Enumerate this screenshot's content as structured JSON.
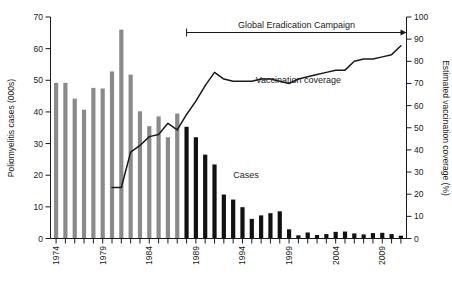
{
  "chart_data": {
    "type": "bar",
    "title": "",
    "xlabel": "",
    "ylabel": "Poliomyelitis cases (000s)",
    "y2label": "Estimated vaccination coverage (%)",
    "ylim": [
      0,
      70
    ],
    "y2lim": [
      0,
      100
    ],
    "xlim": [
      1973.4,
      2011.6
    ],
    "grid": false,
    "legend": "none",
    "x_tick_labels": [
      "1974",
      "1979",
      "1984",
      "1989",
      "1994",
      "1999",
      "2004",
      "2009"
    ],
    "x_tick_label_years": [
      1974,
      1979,
      1984,
      1989,
      1994,
      1999,
      2004,
      2009
    ],
    "y_tick_labels": [
      "0",
      "10",
      "20",
      "30",
      "40",
      "50",
      "60",
      "70"
    ],
    "y_tick_values": [
      0,
      10,
      20,
      30,
      40,
      50,
      60,
      70
    ],
    "y2_tick_labels": [
      "0",
      "10",
      "20",
      "30",
      "40",
      "50",
      "60",
      "70",
      "80",
      "90",
      "100"
    ],
    "y2_tick_values": [
      0,
      10,
      20,
      30,
      40,
      50,
      60,
      70,
      80,
      90,
      100
    ],
    "categories": [
      1974,
      1975,
      1976,
      1977,
      1978,
      1979,
      1980,
      1981,
      1982,
      1983,
      1984,
      1985,
      1986,
      1987,
      1988,
      1989,
      1990,
      1991,
      1992,
      1993,
      1994,
      1995,
      1996,
      1997,
      1998,
      1999,
      2000,
      2001,
      2002,
      2003,
      2004,
      2005,
      2006,
      2007,
      2008,
      2009,
      2010,
      2011
    ],
    "series": [
      {
        "name": "Poliomyelitis cases (000s)",
        "axis": "left",
        "type": "bar",
        "values": [
          49.2,
          49.2,
          44.2,
          40.7,
          47.6,
          47.4,
          52.8,
          66.0,
          51.8,
          40.2,
          35.5,
          38.6,
          32.0,
          39.5,
          35.3,
          32.0,
          26.5,
          23.4,
          13.9,
          12.3,
          9.9,
          6.2,
          7.3,
          8.0,
          8.6,
          2.9,
          1.0,
          1.9,
          1.1,
          1.4,
          2.1,
          2.2,
          1.6,
          1.3,
          1.7,
          1.8,
          1.4,
          0.9
        ],
        "bar_colors": [
          "#8a8a8a",
          "#8a8a8a",
          "#8a8a8a",
          "#8a8a8a",
          "#8a8a8a",
          "#8a8a8a",
          "#8a8a8a",
          "#8a8a8a",
          "#8a8a8a",
          "#8a8a8a",
          "#8a8a8a",
          "#8a8a8a",
          "#8a8a8a",
          "#8a8a8a",
          "#111111",
          "#111111",
          "#111111",
          "#111111",
          "#111111",
          "#111111",
          "#111111",
          "#111111",
          "#111111",
          "#111111",
          "#111111",
          "#111111",
          "#111111",
          "#111111",
          "#111111",
          "#111111",
          "#111111",
          "#111111",
          "#111111",
          "#111111",
          "#111111",
          "#111111",
          "#111111",
          "#111111"
        ],
        "color_gray": "#8a8a8a",
        "color_black": "#111111",
        "gray_years": [
          1974,
          1987
        ],
        "black_years": [
          1988,
          2011
        ],
        "data_label": "Cases"
      },
      {
        "name": "Vaccination coverage",
        "axis": "right",
        "type": "line",
        "color": "#1a1a1a",
        "x": [
          1980,
          1981,
          1982,
          1983,
          1984,
          1985,
          1986,
          1987,
          1988,
          1989,
          1990,
          1991,
          1992,
          1993,
          1994,
          1995,
          1996,
          1997,
          1998,
          1999,
          2000,
          2001,
          2002,
          2003,
          2004,
          2005,
          2006,
          2007,
          2008,
          2009,
          2010,
          2011
        ],
        "values": [
          23,
          23,
          39,
          42,
          46,
          47,
          52,
          49,
          56,
          62,
          69,
          75,
          72,
          71,
          71,
          71,
          72,
          72,
          71,
          70,
          72,
          73,
          74,
          75,
          76,
          76,
          80,
          81,
          81,
          82,
          83,
          87
        ],
        "data_label": "Vaccination coverage"
      }
    ],
    "annotations": [
      {
        "name": "global-eradication-campaign",
        "text": "Global Eradication Campaign",
        "type": "arrow",
        "x_start": 1988,
        "x_end": 2011.6,
        "y2_value": 93
      },
      {
        "name": "cases-label",
        "text": "Cases",
        "x": 1993,
        "y_value": 19
      },
      {
        "name": "vaccination-coverage-label",
        "text": "Vaccination coverage",
        "x": 2000,
        "y2_value": 70
      }
    ]
  },
  "axes": {
    "left_title": "Poliomyelitis cases (000s)",
    "right_title": "Estimated vaccination coverage (%)"
  },
  "labels": {
    "campaign": "Global Eradication Campaign",
    "cases": "Cases",
    "coverage": "Vaccination coverage"
  }
}
